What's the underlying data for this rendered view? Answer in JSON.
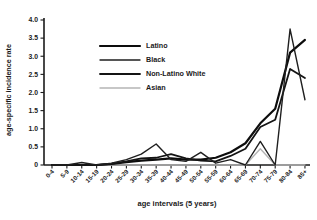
{
  "figure": {
    "background": "#ffffff",
    "axis_color": "#1a1a1a",
    "text_color": "#1a1a1a"
  },
  "chart_data": {
    "type": "line",
    "title": "",
    "xlabel": "age intervals (5 years)",
    "ylabel": "age-specific incidence rate",
    "ylim": [
      0,
      4.0
    ],
    "ytick_step": 0.5,
    "ytick_labels": [
      "0",
      "0.5",
      "1.0",
      "1.5",
      "2.0",
      "2.5",
      "3.0",
      "3.5",
      "4.0"
    ],
    "grid": false,
    "legend_position": "upper-left-inside",
    "categories": [
      "0-4",
      "5-9",
      "10-14",
      "15-19",
      "20-24",
      "25-29",
      "30-34",
      "35-39",
      "40-44",
      "45-49",
      "50-54",
      "55-59",
      "60-64",
      "65-69",
      "70-74",
      "75-79",
      "80-84",
      "85+"
    ],
    "series": [
      {
        "name": "Latino",
        "color": "#0d0d0d",
        "stroke_width": 2.2,
        "values": [
          0,
          0,
          0,
          0,
          0.03,
          0.08,
          0.12,
          0.15,
          0.18,
          0.15,
          0.15,
          0.2,
          0.35,
          0.6,
          1.15,
          1.55,
          3.1,
          3.45
        ]
      },
      {
        "name": "Black",
        "color": "#1f1f1f",
        "stroke_width": 1.4,
        "values": [
          0,
          0,
          0.07,
          0,
          0.05,
          0.15,
          0.3,
          0.58,
          0.15,
          0.1,
          0.35,
          0.05,
          0.15,
          0,
          0.65,
          0,
          3.75,
          1.8
        ]
      },
      {
        "name": "Non-Latino White",
        "color": "#141414",
        "stroke_width": 1.8,
        "values": [
          0,
          0,
          0,
          0,
          0.03,
          0.1,
          0.18,
          0.2,
          0.3,
          0.18,
          0.12,
          0.1,
          0.25,
          0.45,
          1.05,
          1.25,
          2.65,
          2.4
        ]
      },
      {
        "name": "Asian",
        "color": "#b5b5b5",
        "stroke_width": 1.4,
        "values": [
          0,
          0,
          0,
          0,
          0,
          0,
          0,
          0,
          0,
          0,
          0,
          0,
          0,
          0,
          0.45,
          0,
          0,
          0
        ]
      }
    ]
  }
}
